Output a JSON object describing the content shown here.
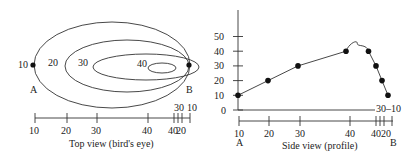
{
  "top_view": {
    "caption": "Top view (bird's eye)",
    "contours": [
      {
        "label": "10"
      },
      {
        "label": "20"
      },
      {
        "label": "30"
      },
      {
        "label": "40"
      }
    ],
    "point_a_label": "A",
    "point_b_label": "B",
    "right_labels": [
      "30",
      "10"
    ],
    "axis_ticks": [
      {
        "value": 10,
        "label": "10"
      },
      {
        "value": 20,
        "label": "20"
      },
      {
        "value": 30,
        "label": "30"
      },
      {
        "value": 40,
        "label": "40"
      },
      {
        "value": 40,
        "label": "40"
      },
      {
        "value": 30,
        "label": ""
      },
      {
        "value": 20,
        "label": "20"
      },
      {
        "value": 10,
        "label": ""
      }
    ]
  },
  "side_view": {
    "caption": "Side view (profile)",
    "point_a_label": "A",
    "point_b_label": "B",
    "right_label": "30–10"
  },
  "chart_data": {
    "type": "line",
    "title": "Side view (profile)",
    "xlabel": "",
    "ylabel": "",
    "y_ticks": [
      0,
      10,
      20,
      30,
      40,
      50
    ],
    "ylim": [
      0,
      60
    ],
    "x_tick_labels": [
      "10",
      "20",
      "30",
      "40",
      "40",
      "20"
    ],
    "x_tick_labels_above": [
      "30",
      "10"
    ],
    "series": [
      {
        "name": "elevation profile A to B",
        "x_positions": [
          0,
          0.2,
          0.4,
          0.72,
          0.87,
          0.92,
          0.96,
          1.0
        ],
        "values": [
          10,
          20,
          30,
          40,
          40,
          30,
          20,
          10
        ],
        "peak_between": {
          "value": 44
        }
      }
    ],
    "grid": false
  }
}
